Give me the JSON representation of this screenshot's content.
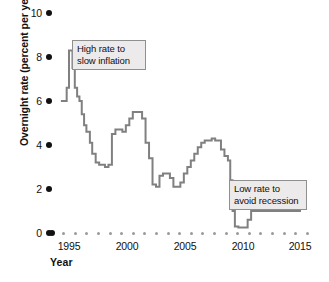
{
  "chart_data": {
    "type": "line",
    "title": "",
    "xlabel": "Year",
    "ylabel": "Overnight rate (percent per year)",
    "xlim": [
      1994,
      2015.5
    ],
    "ylim": [
      0,
      10
    ],
    "grid": false,
    "legend": null,
    "line_color": "#808080",
    "ytick_labels": [
      "10",
      "8",
      "6",
      "4",
      "2",
      "0"
    ],
    "ytick_values": [
      10,
      8,
      6,
      4,
      2,
      0
    ],
    "xtick_labels": [
      "1995",
      "2000",
      "2005",
      "2010",
      "2015"
    ],
    "xtick_values": [
      1995,
      2000,
      2005,
      2010,
      2015
    ],
    "series": [
      {
        "name": "Overnight rate",
        "x": [
          1994.3,
          1994.6,
          1994.8,
          1995.0,
          1995.1,
          1995.3,
          1995.5,
          1995.7,
          1995.9,
          1996.1,
          1996.3,
          1996.5,
          1996.8,
          1997.0,
          1997.3,
          1997.6,
          1997.9,
          1998.1,
          1998.4,
          1998.7,
          1999.0,
          1999.3,
          1999.6,
          1999.9,
          2000.2,
          2000.5,
          2000.8,
          2001.0,
          2001.3,
          2001.6,
          2001.9,
          2002.2,
          2002.5,
          2002.8,
          2003.1,
          2003.4,
          2003.7,
          2004.0,
          2004.3,
          2004.6,
          2004.9,
          2005.2,
          2005.5,
          2005.8,
          2006.1,
          2006.4,
          2006.7,
          2007.0,
          2007.3,
          2007.6,
          2007.9,
          2008.1,
          2008.4,
          2008.7,
          2008.9,
          2009.1,
          2009.3,
          2009.6,
          2009.9,
          2010.1,
          2010.4,
          2010.7,
          2011.0,
          2012.0,
          2013.0,
          2014.0,
          2015.0
        ],
        "y": [
          6.0,
          6.0,
          6.6,
          8.3,
          8.3,
          7.5,
          6.6,
          6.2,
          6.0,
          5.4,
          4.9,
          4.6,
          4.1,
          3.6,
          3.2,
          3.1,
          3.1,
          3.0,
          3.1,
          4.5,
          4.7,
          4.7,
          4.6,
          4.9,
          5.2,
          5.5,
          5.5,
          5.5,
          5.2,
          4.1,
          3.4,
          2.2,
          2.1,
          2.6,
          2.7,
          2.7,
          2.5,
          2.1,
          2.1,
          2.3,
          2.7,
          3.0,
          3.3,
          3.6,
          3.9,
          4.1,
          4.2,
          4.2,
          4.3,
          4.2,
          4.2,
          3.8,
          3.5,
          3.3,
          2.4,
          1.0,
          0.3,
          0.25,
          0.25,
          0.25,
          0.6,
          1.0,
          1.0,
          1.0,
          1.0,
          1.0,
          1.0
        ]
      }
    ],
    "annotations": [
      {
        "id": "high-rate-annotation",
        "line1": "High rate to",
        "line2": "slow inflation",
        "x_px": 72,
        "y_px": 40,
        "width_px": 74
      },
      {
        "id": "low-rate-annotation",
        "line1": "Low rate to",
        "line2": "avoid recession",
        "x_px": 229,
        "y_px": 180,
        "width_px": 78
      }
    ]
  }
}
